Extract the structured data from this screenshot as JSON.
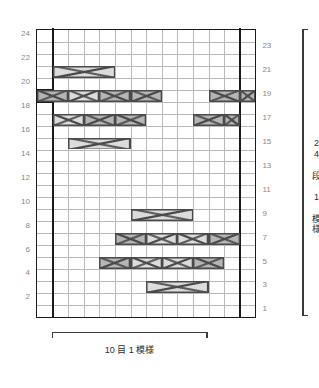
{
  "chart_data": {
    "type": "table",
    "title": "",
    "subtitle": "",
    "xlabel": "",
    "ylabel": "",
    "grid": true,
    "legend_position": "none",
    "columns": 14,
    "rows": 24,
    "row_labels_left": [
      "24",
      "22",
      "20",
      "18",
      "16",
      "14",
      "12",
      "10",
      "8",
      "6",
      "4",
      "2"
    ],
    "row_labels_right": [
      "23",
      "21",
      "19",
      "17",
      "15",
      "13",
      "11",
      "9",
      "7",
      "5",
      "3",
      "1"
    ],
    "repeat_columns": [
      1,
      13
    ],
    "horizontal_repeat_caption": "10 目 1 模様",
    "vertical_repeat_caption": "24 段 1 模様",
    "colors": {
      "grid_line": "#b9b9b9",
      "border": "#1a1a1a",
      "repeat_line": "#1a1a1a",
      "symbol_fill_dark": "#b5b5b5",
      "symbol_fill_light": "#dcdcdc",
      "symbol_stroke": "#4a4a4a",
      "label_text": "#8a8a8a",
      "caption_text": "#2b2b2b"
    },
    "symbols": [
      {
        "row": 21,
        "col": 1,
        "span": 4,
        "kind": "cable-cross-left",
        "shade": "light"
      },
      {
        "row": 19,
        "col": 0,
        "span": 2,
        "kind": "cable-cross-right",
        "shade": "dark"
      },
      {
        "row": 19,
        "col": 2,
        "span": 2,
        "kind": "cable-cross-left",
        "shade": "light"
      },
      {
        "row": 19,
        "col": 4,
        "span": 2,
        "kind": "cable-cross-right",
        "shade": "dark"
      },
      {
        "row": 19,
        "col": 6,
        "span": 2,
        "kind": "cable-cross-left",
        "shade": "dark"
      },
      {
        "row": 19,
        "col": 11,
        "span": 2,
        "kind": "cable-cross-right",
        "shade": "dark"
      },
      {
        "row": 19,
        "col": 13,
        "span": 1,
        "kind": "cable-cross-left",
        "shade": "dark"
      },
      {
        "row": 17,
        "col": 1,
        "span": 2,
        "kind": "cable-cross-right",
        "shade": "light"
      },
      {
        "row": 17,
        "col": 3,
        "span": 2,
        "kind": "cable-cross-left",
        "shade": "dark"
      },
      {
        "row": 17,
        "col": 5,
        "span": 2,
        "kind": "cable-cross-right",
        "shade": "dark"
      },
      {
        "row": 17,
        "col": 10,
        "span": 2,
        "kind": "cable-cross-left",
        "shade": "dark"
      },
      {
        "row": 17,
        "col": 12,
        "span": 1,
        "kind": "cable-cross-right",
        "shade": "dark"
      },
      {
        "row": 15,
        "col": 2,
        "span": 4,
        "kind": "cable-cross-left",
        "shade": "light"
      },
      {
        "row": 9,
        "col": 6,
        "span": 4,
        "kind": "cable-cross-left",
        "shade": "light"
      },
      {
        "row": 7,
        "col": 5,
        "span": 2,
        "kind": "cable-cross-right",
        "shade": "dark"
      },
      {
        "row": 7,
        "col": 7,
        "span": 2,
        "kind": "cable-cross-left",
        "shade": "light"
      },
      {
        "row": 7,
        "col": 9,
        "span": 2,
        "kind": "cable-cross-right",
        "shade": "light"
      },
      {
        "row": 7,
        "col": 11,
        "span": 2,
        "kind": "cable-cross-left",
        "shade": "dark"
      },
      {
        "row": 5,
        "col": 4,
        "span": 2,
        "kind": "cable-cross-left",
        "shade": "dark"
      },
      {
        "row": 5,
        "col": 6,
        "span": 2,
        "kind": "cable-cross-right",
        "shade": "light"
      },
      {
        "row": 5,
        "col": 8,
        "span": 2,
        "kind": "cable-cross-left",
        "shade": "light"
      },
      {
        "row": 5,
        "col": 10,
        "span": 2,
        "kind": "cable-cross-right",
        "shade": "dark"
      },
      {
        "row": 3,
        "col": 7,
        "span": 4,
        "kind": "cable-cross-left",
        "shade": "light"
      }
    ]
  }
}
